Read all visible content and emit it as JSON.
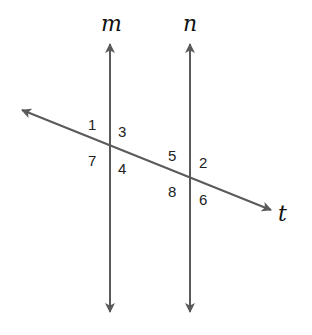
{
  "diagram": {
    "type": "parallel-lines-transversal",
    "colors": {
      "line": "#5a5a5a",
      "text": "#222222"
    },
    "lines": {
      "m": {
        "label": "m",
        "x": 110,
        "y_top": 44,
        "y_bottom": 312
      },
      "n": {
        "label": "n",
        "x": 190,
        "y_top": 44,
        "y_bottom": 312
      },
      "t": {
        "label": "t",
        "x1": 22,
        "y1": 110,
        "x2": 271,
        "y2": 210
      }
    },
    "intersections": {
      "m_t": {
        "x": 110,
        "y": 146
      },
      "n_t": {
        "x": 190,
        "y": 177
      }
    },
    "angles": [
      {
        "id": "1",
        "label": "1",
        "x": 92,
        "y": 129
      },
      {
        "id": "3",
        "label": "3",
        "x": 120,
        "y": 137
      },
      {
        "id": "7",
        "label": "7",
        "x": 92,
        "y": 166
      },
      {
        "id": "4",
        "label": "4",
        "x": 120,
        "y": 174
      },
      {
        "id": "5",
        "label": "5",
        "x": 172,
        "y": 161
      },
      {
        "id": "2",
        "label": "2",
        "x": 200,
        "y": 168
      },
      {
        "id": "8",
        "label": "8",
        "x": 172,
        "y": 198
      },
      {
        "id": "6",
        "label": "6",
        "x": 200,
        "y": 205
      }
    ]
  }
}
